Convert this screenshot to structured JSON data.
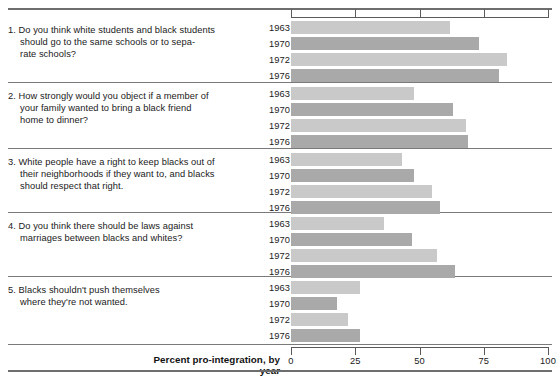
{
  "chart_data": {
    "type": "bar",
    "title": "",
    "orientation": "horizontal",
    "xlabel": "Percent pro-integration, by year",
    "ylabel": "",
    "xlim": [
      0,
      100
    ],
    "xticks": [
      0,
      25,
      50,
      75,
      100
    ],
    "xtick_labels": [
      "0",
      "25",
      "50",
      "75",
      "100"
    ],
    "grid": false,
    "legend": "none",
    "categories": [
      "1963",
      "1970",
      "1972",
      "1976"
    ],
    "groups": [
      {
        "number": "1.",
        "question": "Do you think white students and black students\nshould go to the same schools or to sepa-\nrate schools?",
        "values": [
          62,
          73,
          84,
          81
        ]
      },
      {
        "number": "2.",
        "question": "How strongly would you object if a member of\nyour family wanted to bring a black friend\nhome to dinner?",
        "values": [
          48,
          63,
          68,
          69
        ]
      },
      {
        "number": "3.",
        "question": "White people have a right to keep blacks out of\ntheir neighborhoods if they want to, and blacks\nshould respect that right.",
        "values": [
          43,
          48,
          55,
          58
        ]
      },
      {
        "number": "4.",
        "question": "Do you think there should be laws against\nmarriages between blacks and whites?",
        "values": [
          36,
          47,
          57,
          64
        ]
      },
      {
        "number": "5.",
        "question": "Blacks shouldn't push themselves\nwhere they're not wanted.",
        "values": [
          27,
          18,
          22,
          27
        ]
      }
    ],
    "bar_colors": [
      "#c9c9c9",
      "#a9a9a9",
      "#c9c9c9",
      "#a9a9a9"
    ],
    "rule_color": "#6e6e6e",
    "text_color": "#1a1a1a"
  },
  "axis": {
    "title": "Percent pro-integration, by year",
    "ticks": [
      "0",
      "25",
      "50",
      "75",
      "100"
    ]
  }
}
